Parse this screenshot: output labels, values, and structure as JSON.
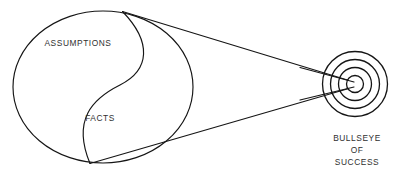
{
  "figure": {
    "kind": "concept-diagram",
    "background_color": "#ffffff",
    "line_color": "#151515",
    "text_color": "#303030"
  },
  "source_circle": {
    "name": "assumptions-facts-circle",
    "upper_label": "ASSUMPTIONS",
    "lower_label": "FACTS",
    "divider": "s-curve"
  },
  "target": {
    "name": "bullseye-target",
    "ring_count": 3,
    "has_center_dot": true,
    "caption_lines": [
      "BULLSEYE",
      "OF",
      "SUCCESS"
    ],
    "caption_full": "BULLSEYE OF SUCCESS"
  },
  "cone": {
    "name": "projection-cone",
    "line_count": 2,
    "description": "tangent lines from circle to target"
  }
}
